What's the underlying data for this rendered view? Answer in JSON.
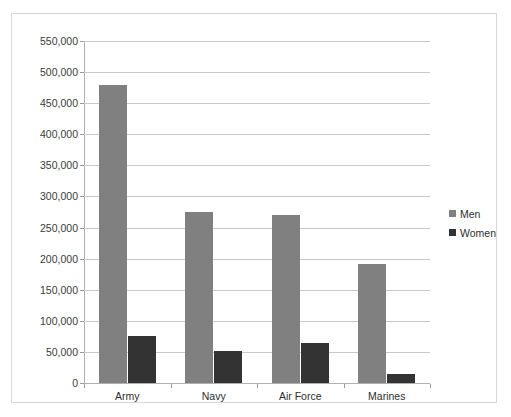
{
  "chart_data": {
    "type": "bar",
    "title": "",
    "xlabel": "",
    "ylabel": "",
    "categories": [
      "Army",
      "Navy",
      "Air Force",
      "Marines"
    ],
    "series": [
      {
        "name": "Men",
        "color": "#808080",
        "values": [
          480000,
          275000,
          270000,
          192000
        ]
      },
      {
        "name": "Women",
        "color": "#333333",
        "values": [
          75000,
          52000,
          65000,
          15000
        ]
      }
    ],
    "ylim": [
      0,
      550000
    ],
    "ytick_step": 50000,
    "ytick_labels": [
      "0",
      "50,000",
      "100,000",
      "150,000",
      "200,000",
      "250,000",
      "300,000",
      "350,000",
      "400,000",
      "450,000",
      "500,000",
      "550,000"
    ],
    "ytick_values": [
      0,
      50000,
      100000,
      150000,
      200000,
      250000,
      300000,
      350000,
      400000,
      450000,
      500000,
      550000
    ],
    "grid": "horizontal",
    "legend_position": "right",
    "legend_entries": [
      "Men",
      "Women"
    ],
    "plot_background": "#ffffff",
    "gridline_color": "#c9c9c9",
    "border_color": "#d8d8d8"
  }
}
